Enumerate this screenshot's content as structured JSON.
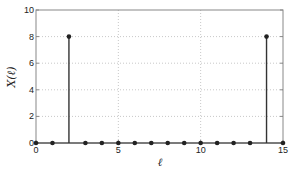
{
  "chart_data": {
    "type": "stem",
    "title": "",
    "xlabel": "ℓ",
    "ylabel": "X(ℓ)",
    "x": [
      0,
      1,
      2,
      3,
      4,
      5,
      6,
      7,
      8,
      9,
      10,
      11,
      12,
      13,
      14,
      15
    ],
    "values": [
      0,
      0,
      8,
      0,
      0,
      0,
      0,
      0,
      0,
      0,
      0,
      0,
      0,
      0,
      8,
      0
    ],
    "xlim": [
      0,
      15
    ],
    "ylim": [
      0,
      10
    ],
    "xticks": [
      0,
      5,
      10,
      15
    ],
    "xtick_labels": [
      "0",
      "5",
      "10",
      "15"
    ],
    "yticks": [
      0,
      2,
      4,
      6,
      8,
      10
    ],
    "ytick_labels": [
      "0",
      "2",
      "4",
      "6",
      "8",
      "10"
    ],
    "grid": true,
    "colors": {
      "stem": "#333333",
      "marker": "#222222",
      "axis": "#888888",
      "grid": "#c8c8c8"
    }
  }
}
